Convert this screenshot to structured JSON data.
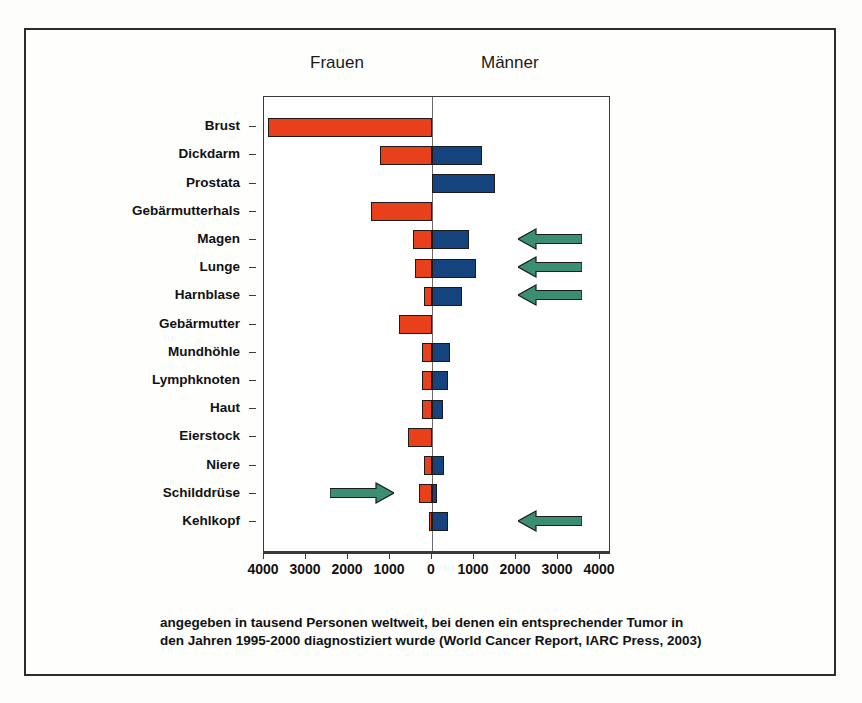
{
  "headings": {
    "left": "Frauen",
    "right": "Männer"
  },
  "caption": {
    "line1": "angegeben in tausend Personen weltweit, bei denen ein entsprechender Tumor in",
    "line2": "den Jahren 1995-2000 diagnostiziert wurde (World Cancer Report, IARC Press, 2003)"
  },
  "colors": {
    "female_bar": "#e8401a",
    "male_bar": "#14437e",
    "arrow": "#3a8f72",
    "frame": "#2c2c2c",
    "axis": "#3a3a3a"
  },
  "chart_data": {
    "type": "bar",
    "orientation": "horizontal-diverging",
    "title": "",
    "subtitle": "",
    "xlabel": "",
    "ylabel": "",
    "unit": "tausend Personen",
    "grid": false,
    "legend_position": "top",
    "xlim": [
      -4000,
      4000
    ],
    "xticks": [
      4000,
      3000,
      2000,
      1000,
      0,
      1000,
      2000,
      3000,
      4000
    ],
    "xtick_labels": [
      "4000",
      "3000",
      "2000",
      "1000",
      "0",
      "1000",
      "2000",
      "3000",
      "4000"
    ],
    "categories": [
      "Brust",
      "Dickdarm",
      "Prostata",
      "Gebärmutterhals",
      "Magen",
      "Lunge",
      "Harnblase",
      "Gebärmutter",
      "Mundhöhle",
      "Lymphknoten",
      "Haut",
      "Eierstock",
      "Niere",
      "Schilddrüse",
      "Kehlkopf"
    ],
    "series": [
      {
        "name": "Frauen",
        "color": "#e8401a",
        "direction": "left",
        "values": [
          3900,
          1250,
          0,
          1450,
          450,
          400,
          180,
          780,
          230,
          250,
          230,
          560,
          190,
          320,
          60
        ]
      },
      {
        "name": "Männer",
        "color": "#14437e",
        "direction": "right",
        "values": [
          0,
          1200,
          1500,
          0,
          870,
          1050,
          720,
          0,
          430,
          370,
          270,
          0,
          290,
          110,
          380
        ]
      }
    ],
    "annotations": [
      {
        "label": "arrow-magen",
        "category": "Magen",
        "direction": "left",
        "color": "#3a8f72"
      },
      {
        "label": "arrow-lunge",
        "category": "Lunge",
        "direction": "left",
        "color": "#3a8f72"
      },
      {
        "label": "arrow-harnblase",
        "category": "Harnblase",
        "direction": "left",
        "color": "#3a8f72"
      },
      {
        "label": "arrow-schilddruese",
        "category": "Schilddrüse",
        "direction": "right",
        "color": "#3a8f72"
      },
      {
        "label": "arrow-kehlkopf",
        "category": "Kehlkopf",
        "direction": "left",
        "color": "#3a8f72"
      }
    ]
  }
}
